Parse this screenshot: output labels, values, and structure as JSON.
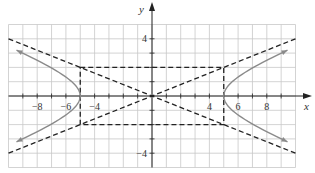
{
  "chart_data": {
    "type": "line",
    "title": "",
    "xlabel": "x",
    "ylabel": "y",
    "xlim": [
      -10,
      10
    ],
    "ylim": [
      -5,
      5
    ],
    "grid": true,
    "x_tick_labels": [
      "-8",
      "-6",
      "-4",
      "4",
      "6",
      "8"
    ],
    "x_tick_values": [
      -8,
      -6,
      -4,
      4,
      6,
      8
    ],
    "y_tick_labels": [
      "4",
      "-4"
    ],
    "y_tick_values": [
      4,
      -4
    ],
    "series": [
      {
        "name": "hyperbola",
        "equation": "x^2/25 - y^2/4 = 1",
        "style": "solid gray with arrows",
        "vertices": [
          [
            -5,
            0
          ],
          [
            5,
            0
          ]
        ]
      },
      {
        "name": "asymptote 1",
        "equation": "y = 2x/5",
        "style": "dashed"
      },
      {
        "name": "asymptote 2",
        "equation": "y = -2x/5",
        "style": "dashed"
      },
      {
        "name": "fundamental rectangle",
        "corners": [
          [
            -5,
            2
          ],
          [
            5,
            2
          ],
          [
            5,
            -2
          ],
          [
            -5,
            -2
          ]
        ],
        "style": "dashed"
      }
    ]
  },
  "labels": {
    "x_axis": "x",
    "y_axis": "y",
    "ticks_x": [
      {
        "value": -8,
        "text": "−8"
      },
      {
        "value": -6,
        "text": "−6"
      },
      {
        "value": -4,
        "text": "−4"
      },
      {
        "value": 4,
        "text": "4"
      },
      {
        "value": 6,
        "text": "6"
      },
      {
        "value": 8,
        "text": "8"
      }
    ],
    "ticks_y": [
      {
        "value": 4,
        "text": "4"
      },
      {
        "value": -4,
        "text": "−4"
      }
    ]
  },
  "colors": {
    "grid": "#c8c8c8",
    "axis": "#222222",
    "curve": "#8a8a8a",
    "dashed": "#222222"
  }
}
